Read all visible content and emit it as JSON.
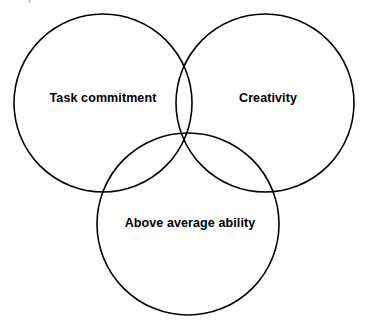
{
  "diagram": {
    "type": "venn",
    "background_color": "#ffffff",
    "stroke_color": "#000000",
    "text_color": "#000000",
    "stroke_width": 1.6,
    "canvas": {
      "width": 369,
      "height": 328
    },
    "circles": [
      {
        "id": "task-commitment",
        "label": "Task commitment",
        "cx": 103,
        "cy": 103,
        "r": 89,
        "label_x": 103,
        "label_y": 99
      },
      {
        "id": "creativity",
        "label": "Creativity",
        "cx": 265,
        "cy": 103,
        "r": 89,
        "label_x": 268,
        "label_y": 99
      },
      {
        "id": "above-average-ability",
        "label": "Above average ability",
        "cx": 188,
        "cy": 224,
        "r": 91,
        "label_x": 190,
        "label_y": 224
      }
    ]
  }
}
